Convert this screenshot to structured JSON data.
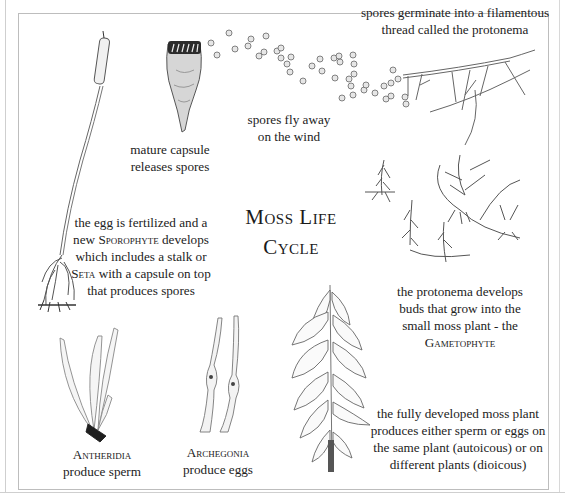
{
  "title": {
    "line1": "Moss Life",
    "line2": "Cycle"
  },
  "stages": {
    "capsule": {
      "line1": "mature capsule",
      "line2": "releases spores"
    },
    "spores": {
      "line1": "spores fly away",
      "line2": "on the wind"
    },
    "protonema": {
      "line1": "spores germinate into a filamentous",
      "line2": "thread called the protonema"
    },
    "gametophyte": {
      "line1": "the protonema develops",
      "line2": "buds that grow into the",
      "line3": "small moss plant - the",
      "term": "Gametophyte"
    },
    "mature_plant": {
      "line1": "the fully developed moss plant",
      "line2": "produces either sperm or eggs on",
      "line3": "the same plant (autoicous) or on",
      "line4": "different  plants (dioicous)"
    },
    "archegonia": {
      "term": "Archegonia",
      "line2": "produce eggs"
    },
    "antheridia": {
      "term": "Antheridia",
      "line2": "produce sperm"
    },
    "sporophyte": {
      "line1": "the egg is fertilized and a",
      "line2_pre": "new ",
      "line2_term": "Sporophyte",
      "line2_post": " develops",
      "line3": "which includes a stalk or",
      "line4_term": "Seta",
      "line4_post": " with a capsule on top",
      "line5": "that produces spores"
    }
  },
  "illustrations": [
    "sporophyte-stalk-illustration",
    "mature-capsule-illustration",
    "spores-illustration",
    "protonema-illustration",
    "young-gametophytes-illustration",
    "mature-moss-shoot-illustration",
    "archegonia-illustration",
    "antheridia-illustration"
  ]
}
